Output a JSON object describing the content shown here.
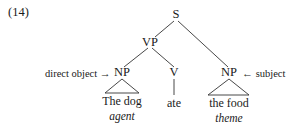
{
  "example_number": "(14)",
  "tree": {
    "root": "S",
    "vp": "VP",
    "np_left": "NP",
    "v": "V",
    "np_right": "NP",
    "words": {
      "np_left": "The dog",
      "v": "ate",
      "np_right": "the food"
    },
    "roles": {
      "np_left": "agent",
      "np_right": "theme"
    }
  },
  "annotations": {
    "left": {
      "label": "direct object",
      "arrow": "→"
    },
    "right": {
      "label": "subject",
      "arrow": "←"
    }
  }
}
